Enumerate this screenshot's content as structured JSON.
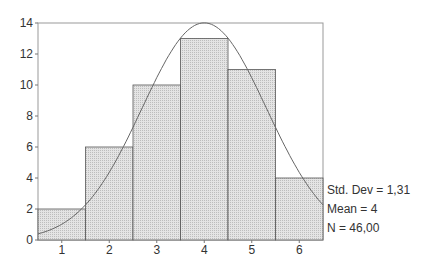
{
  "chart_data": {
    "type": "bar",
    "title": "",
    "xlabel": "",
    "ylabel": "",
    "categories": [
      "1",
      "2",
      "3",
      "4",
      "5",
      "6"
    ],
    "values": [
      2,
      6,
      10,
      13,
      11,
      4
    ],
    "ylim": [
      0,
      14
    ],
    "yticks": [
      "0",
      "2",
      "4",
      "6",
      "8",
      "10",
      "12",
      "14"
    ],
    "overlay": {
      "type": "normal-curve",
      "mean": 4,
      "std_dev": 1.31,
      "n": 46
    },
    "grid": false,
    "legend": null,
    "stats": {
      "std_dev": "Std. Dev = 1,31",
      "mean": "Mean = 4",
      "n": "N = 46,00"
    },
    "colors": {
      "bar_fill": "#d9d9d9",
      "bar_stroke": "#555555",
      "frame": "#999999",
      "curve": "#666666"
    }
  }
}
